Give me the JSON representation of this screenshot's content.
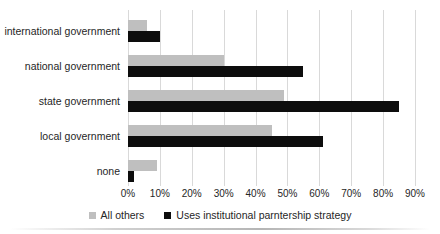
{
  "chart_data": {
    "type": "bar",
    "orientation": "horizontal",
    "title": "",
    "categories": [
      "international government",
      "national government",
      "state government",
      "local government",
      "none"
    ],
    "series": [
      {
        "name": "All others",
        "color": "#bfbfbf",
        "values": [
          6,
          30,
          49,
          45,
          9
        ]
      },
      {
        "name": "Uses institutional parntership strategy",
        "color": "#0d0d0d",
        "values": [
          10,
          55,
          85,
          61,
          2
        ]
      }
    ],
    "xlim": [
      0,
      90
    ],
    "tick_step": 10,
    "tick_labels": [
      "0%",
      "10%",
      "20%",
      "30%",
      "40%",
      "50%",
      "60%",
      "70%",
      "80%",
      "90%"
    ],
    "grid": true,
    "legend_position": "bottom"
  },
  "colors": {
    "background": "#ffffff",
    "gridline": "#d9d9d9",
    "text": "#262626",
    "series_all_others": "#bfbfbf",
    "series_uses_strategy": "#0d0d0d"
  }
}
